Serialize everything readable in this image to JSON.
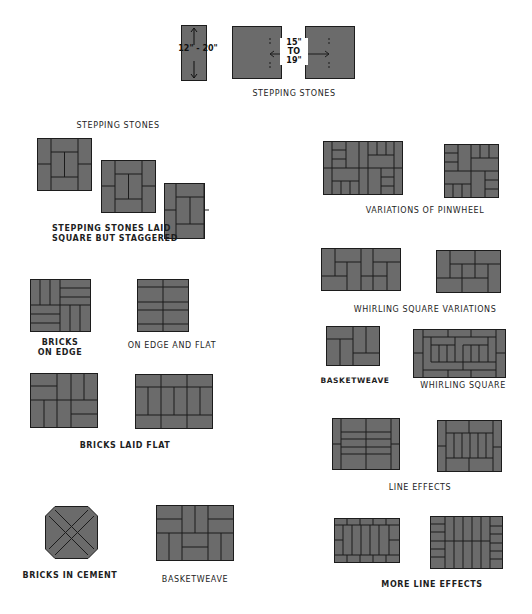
{
  "colors": {
    "tile_fill": "#6b6b6b",
    "joint_line": "#1c1c1c",
    "background": "#ffffff"
  },
  "labels": {
    "stepping_stones_top": "STEPPING STONES",
    "stepping_stones": "STEPPING STONES",
    "stepping_stones_staggered_1": "STEPPING STONES LAID",
    "stepping_stones_staggered_2": "SQUARE BUT STAGGERED",
    "bricks_on_edge_1": "BRICKS",
    "bricks_on_edge_2": "ON EDGE",
    "on_edge_and_flat": "ON EDGE AND FLAT",
    "bricks_laid_flat": "BRICKS LAID FLAT",
    "bricks_in_cement": "BRICKS IN CEMENT",
    "basketweave_left": "BASKETWEAVE",
    "variations_of_pinwheel": "VARIATIONS OF PINWHEEL",
    "whirling_square_variations": "WHIRLING SQUARE VARIATIONS",
    "basketweave_right": "BASKETWEAVE",
    "whirling_square": "WHIRLING SQUARE",
    "line_effects": "LINE EFFECTS",
    "more_line_effects": "MORE LINE EFFECTS"
  },
  "dimensions": {
    "stone_size": "12\" - 20\"",
    "spacing_1": "15\"",
    "spacing_2": "TO",
    "spacing_3": "19\""
  }
}
